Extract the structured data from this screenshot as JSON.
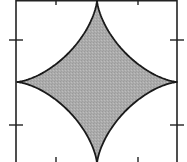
{
  "figure": {
    "frame": {
      "left": 16,
      "right": 177,
      "top": 0,
      "bottom": 164,
      "stroke": "#222222"
    },
    "shape": {
      "center_x": 97,
      "center_y": 82,
      "cusps": {
        "top": [
          97,
          0
        ],
        "right": [
          177,
          82
        ],
        "bottom": [
          97,
          164
        ],
        "left": [
          16,
          82
        ]
      },
      "fill": "#a9a9a9",
      "stroke": "#1a1a1a"
    },
    "ticks": {
      "top_x": [
        56,
        138
      ],
      "bottom_x": [
        56,
        138
      ],
      "left_y": [
        40,
        125
      ],
      "right_y": [
        40,
        125
      ]
    }
  }
}
